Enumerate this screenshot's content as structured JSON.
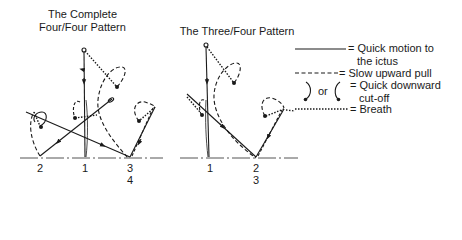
{
  "diagrams": [
    {
      "title_line1": "The Complete",
      "title_line2": "Four/Four Pattern",
      "beat_labels": [
        "2",
        "1",
        "3",
        "4"
      ]
    },
    {
      "title": "The Three/Four Pattern",
      "beat_labels": [
        "1",
        "2",
        "3"
      ]
    }
  ],
  "legend": {
    "items": [
      {
        "symbol": "solid-line",
        "label_line1": "= Quick motion to",
        "label_line2": "the ictus"
      },
      {
        "symbol": "dashed-line",
        "label_line1": "= Slow upward pull"
      },
      {
        "symbol": "hook-curves",
        "or_text": "or",
        "label_line1": "= Quick downward",
        "label_line2": "cut-off"
      },
      {
        "symbol": "dotted-line",
        "label_line1": "= Breath"
      }
    ]
  },
  "colors": {
    "ink": "#1a1a1a",
    "baseline": "#555555",
    "background": "#ffffff"
  }
}
